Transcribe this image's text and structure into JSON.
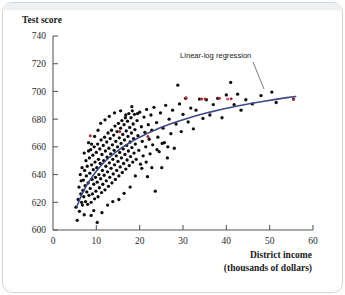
{
  "figure": {
    "background_color": "#ffffff",
    "frame_color": "#cfd6dd"
  },
  "labels": {
    "ylabel": "Test score",
    "xlabel_line1": "District income",
    "xlabel_line2": "(thousands of dollars)",
    "annotation": "Linear-log regression"
  },
  "chart_data": {
    "type": "scatter",
    "title": "",
    "xlabel": "District income (thousands of dollars)",
    "ylabel": "Test score",
    "xlim": [
      0,
      60
    ],
    "ylim": [
      600,
      740
    ],
    "xticks": [
      0,
      10,
      20,
      30,
      40,
      50,
      60
    ],
    "yticks": [
      600,
      620,
      640,
      660,
      680,
      700,
      720,
      740
    ],
    "grid": false,
    "legend": "none",
    "annotations": [
      {
        "text": "Linear-log regression",
        "x": 30.5,
        "y": 722,
        "leader_to_x": 42.0,
        "leader_to_y": 700.5
      }
    ],
    "series": [
      {
        "name": "Linear-log regression",
        "type": "line",
        "color": "#3c4a86",
        "equation_form": "TestScore = a + b*ln(Income)",
        "x": [
          5.5,
          6.5,
          7.5,
          8.5,
          9.5,
          10.5,
          12,
          14,
          16,
          18,
          20,
          22.5,
          25,
          27.5,
          30,
          33,
          36,
          39,
          42,
          45,
          48,
          51,
          54,
          56
        ],
        "y": [
          617.0,
          624.6,
          630.8,
          636.0,
          640.4,
          644.4,
          649.6,
          655.1,
          659.6,
          663.6,
          667.0,
          670.8,
          674.1,
          677.0,
          679.6,
          682.4,
          684.9,
          687.1,
          689.1,
          690.9,
          692.5,
          694.1,
          695.5,
          696.4
        ]
      },
      {
        "name": "Districts",
        "type": "scatter",
        "color": "#0d0d0d",
        "n_points": 420,
        "points": [
          [
            5.3,
            616.5
          ],
          [
            5.6,
            607.0
          ],
          [
            5.8,
            622.0
          ],
          [
            6.0,
            631.0
          ],
          [
            6.1,
            613.5
          ],
          [
            6.3,
            640.0
          ],
          [
            6.4,
            626.0
          ],
          [
            6.5,
            635.5
          ],
          [
            6.6,
            620.0
          ],
          [
            6.7,
            645.0
          ],
          [
            6.8,
            618.0
          ],
          [
            6.9,
            628.5
          ],
          [
            7.0,
            636.0
          ],
          [
            7.1,
            624.0
          ],
          [
            7.2,
            655.5
          ],
          [
            7.3,
            643.0
          ],
          [
            7.4,
            632.0
          ],
          [
            7.5,
            620.5
          ],
          [
            7.6,
            650.0
          ],
          [
            7.7,
            639.0
          ],
          [
            7.8,
            627.5
          ],
          [
            7.9,
            646.0
          ],
          [
            8.0,
            618.5
          ],
          [
            8.1,
            634.0
          ],
          [
            8.2,
            663.0
          ],
          [
            8.3,
            625.0
          ],
          [
            8.4,
            652.0
          ],
          [
            8.5,
            641.0
          ],
          [
            8.6,
            630.0
          ],
          [
            8.7,
            658.0
          ],
          [
            8.8,
            620.0
          ],
          [
            8.9,
            647.0
          ],
          [
            9.0,
            636.5
          ],
          [
            9.1,
            626.0
          ],
          [
            9.2,
            654.0
          ],
          [
            9.3,
            643.5
          ],
          [
            9.4,
            633.0
          ],
          [
            9.5,
            660.0
          ],
          [
            9.6,
            622.5
          ],
          [
            9.7,
            649.0
          ],
          [
            9.8,
            638.0
          ],
          [
            9.9,
            628.0
          ],
          [
            10.0,
            656.0
          ],
          [
            10.1,
            645.0
          ],
          [
            10.2,
            634.5
          ],
          [
            10.3,
            662.0
          ],
          [
            10.4,
            624.0
          ],
          [
            10.5,
            651.0
          ],
          [
            10.6,
            640.0
          ],
          [
            10.7,
            630.5
          ],
          [
            10.8,
            658.5
          ],
          [
            10.9,
            648.0
          ],
          [
            11.0,
            637.0
          ],
          [
            11.1,
            665.0
          ],
          [
            11.2,
            627.0
          ],
          [
            11.3,
            654.5
          ],
          [
            11.4,
            643.0
          ],
          [
            11.5,
            633.0
          ],
          [
            11.6,
            661.0
          ],
          [
            11.7,
            650.0
          ],
          [
            11.8,
            639.5
          ],
          [
            11.9,
            667.0
          ],
          [
            12.0,
            629.0
          ],
          [
            12.1,
            657.0
          ],
          [
            12.2,
            646.0
          ],
          [
            12.3,
            635.5
          ],
          [
            12.4,
            663.5
          ],
          [
            12.5,
            652.5
          ],
          [
            12.6,
            642.0
          ],
          [
            12.7,
            670.0
          ],
          [
            12.8,
            631.5
          ],
          [
            12.9,
            659.0
          ],
          [
            13.0,
            648.5
          ],
          [
            13.1,
            638.0
          ],
          [
            13.2,
            666.0
          ],
          [
            13.3,
            655.0
          ],
          [
            13.4,
            644.5
          ],
          [
            13.5,
            672.0
          ],
          [
            13.6,
            634.0
          ],
          [
            13.7,
            661.5
          ],
          [
            13.8,
            651.0
          ],
          [
            13.9,
            640.5
          ],
          [
            14.0,
            668.5
          ],
          [
            14.1,
            657.5
          ],
          [
            14.2,
            647.0
          ],
          [
            14.3,
            675.0
          ],
          [
            14.4,
            636.5
          ],
          [
            14.5,
            664.0
          ],
          [
            14.6,
            653.5
          ],
          [
            14.7,
            643.0
          ],
          [
            14.8,
            671.0
          ],
          [
            14.9,
            660.0
          ],
          [
            15.0,
            649.5
          ],
          [
            15.1,
            677.0
          ],
          [
            15.2,
            639.0
          ],
          [
            15.3,
            666.5
          ],
          [
            15.4,
            656.0
          ],
          [
            15.5,
            645.5
          ],
          [
            15.6,
            673.5
          ],
          [
            15.7,
            662.5
          ],
          [
            15.8,
            652.0
          ],
          [
            15.9,
            679.0
          ],
          [
            16.0,
            641.5
          ],
          [
            16.1,
            669.0
          ],
          [
            16.2,
            658.5
          ],
          [
            16.3,
            648.0
          ],
          [
            16.4,
            676.0
          ],
          [
            16.5,
            665.0
          ],
          [
            16.6,
            654.5
          ],
          [
            16.7,
            681.0
          ],
          [
            16.8,
            644.0
          ],
          [
            16.9,
            671.5
          ],
          [
            17.0,
            661.0
          ],
          [
            17.1,
            650.5
          ],
          [
            17.2,
            678.5
          ],
          [
            17.3,
            667.5
          ],
          [
            17.4,
            657.0
          ],
          [
            17.5,
            684.0
          ],
          [
            17.6,
            646.5
          ],
          [
            17.7,
            674.0
          ],
          [
            17.8,
            663.5
          ],
          [
            17.9,
            653.0
          ],
          [
            18.0,
            681.0
          ],
          [
            18.1,
            670.0
          ],
          [
            18.2,
            659.5
          ],
          [
            18.3,
            686.0
          ],
          [
            18.4,
            649.0
          ],
          [
            18.5,
            676.5
          ],
          [
            18.6,
            666.0
          ],
          [
            18.7,
            655.5
          ],
          [
            18.8,
            683.5
          ],
          [
            18.9,
            672.5
          ],
          [
            19.0,
            662.0
          ],
          [
            19.2,
            651.0
          ],
          [
            19.4,
            679.0
          ],
          [
            19.6,
            668.0
          ],
          [
            19.8,
            657.5
          ],
          [
            20.0,
            685.0
          ],
          [
            20.2,
            647.5
          ],
          [
            20.4,
            674.5
          ],
          [
            20.6,
            664.0
          ],
          [
            20.8,
            653.5
          ],
          [
            21.0,
            681.5
          ],
          [
            21.2,
            670.5
          ],
          [
            21.4,
            660.0
          ],
          [
            21.6,
            687.0
          ],
          [
            21.8,
            638.5
          ],
          [
            22.0,
            676.0
          ],
          [
            22.2,
            665.5
          ],
          [
            22.4,
            655.0
          ],
          [
            22.6,
            683.0
          ],
          [
            22.8,
            672.0
          ],
          [
            23.0,
            661.5
          ],
          [
            23.3,
            688.5
          ],
          [
            23.6,
            628.0
          ],
          [
            23.9,
            677.5
          ],
          [
            24.2,
            667.0
          ],
          [
            24.5,
            656.5
          ],
          [
            24.8,
            684.5
          ],
          [
            25.1,
            645.0
          ],
          [
            25.4,
            673.5
          ],
          [
            25.7,
            663.0
          ],
          [
            26.0,
            690.0
          ],
          [
            26.4,
            652.0
          ],
          [
            26.8,
            680.0
          ],
          [
            27.2,
            669.5
          ],
          [
            27.6,
            686.5
          ],
          [
            28.0,
            659.0
          ],
          [
            28.4,
            676.5
          ],
          [
            28.8,
            704.5
          ],
          [
            29.2,
            691.0
          ],
          [
            29.6,
            671.0
          ],
          [
            30.0,
            683.5
          ],
          [
            30.6,
            695.0
          ],
          [
            31.2,
            678.0
          ],
          [
            31.8,
            688.0
          ],
          [
            32.4,
            673.0
          ],
          [
            33.0,
            686.5
          ],
          [
            33.8,
            694.5
          ],
          [
            34.6,
            680.5
          ],
          [
            35.4,
            694.0
          ],
          [
            36.2,
            683.0
          ],
          [
            37.0,
            690.5
          ],
          [
            38.0,
            695.0
          ],
          [
            39.0,
            681.0
          ],
          [
            40.0,
            697.5
          ],
          [
            41.0,
            706.5
          ],
          [
            41.8,
            690.5
          ],
          [
            42.6,
            698.0
          ],
          [
            43.4,
            686.5
          ],
          [
            44.5,
            694.0
          ],
          [
            46.0,
            691.0
          ],
          [
            48.0,
            697.0
          ],
          [
            50.5,
            699.5
          ],
          [
            51.5,
            692.0
          ],
          [
            55.5,
            694.5
          ],
          [
            7.2,
            611.0
          ],
          [
            8.8,
            610.5
          ],
          [
            10.2,
            605.5
          ],
          [
            11.3,
            612.5
          ],
          [
            9.4,
            614.0
          ],
          [
            12.6,
            618.0
          ],
          [
            13.8,
            620.5
          ],
          [
            15.2,
            622.0
          ],
          [
            16.4,
            626.5
          ],
          [
            17.8,
            631.0
          ],
          [
            19.0,
            639.0
          ],
          [
            20.5,
            644.5
          ],
          [
            21.5,
            649.0
          ],
          [
            22.8,
            645.0
          ],
          [
            24.0,
            658.0
          ],
          [
            25.2,
            662.5
          ],
          [
            26.5,
            660.0
          ],
          [
            12.0,
            679.5
          ],
          [
            13.0,
            682.0
          ],
          [
            14.2,
            684.5
          ],
          [
            15.6,
            686.0
          ],
          [
            16.8,
            683.0
          ],
          [
            18.2,
            689.0
          ],
          [
            19.5,
            684.0
          ],
          [
            11.0,
            677.0
          ],
          [
            10.4,
            672.0
          ],
          [
            9.6,
            667.5
          ],
          [
            8.9,
            662.0
          ],
          [
            8.2,
            657.0
          ]
        ]
      },
      {
        "name": "Highlighted districts",
        "type": "scatter",
        "color": "#b02a2a",
        "points": [
          [
            30.7,
            695.5
          ],
          [
            34.3,
            694.5
          ],
          [
            35.1,
            694.5
          ],
          [
            38.4,
            695.0
          ],
          [
            41.1,
            694.8
          ],
          [
            55.5,
            694.6
          ],
          [
            8.6,
            668.0
          ],
          [
            15.4,
            671.0
          ],
          [
            21.9,
            667.5
          ]
        ]
      },
      {
        "name": "Accent district",
        "type": "scatter",
        "color": "#cf4f86",
        "points": [
          [
            40.3,
            694.5
          ]
        ]
      }
    ]
  }
}
